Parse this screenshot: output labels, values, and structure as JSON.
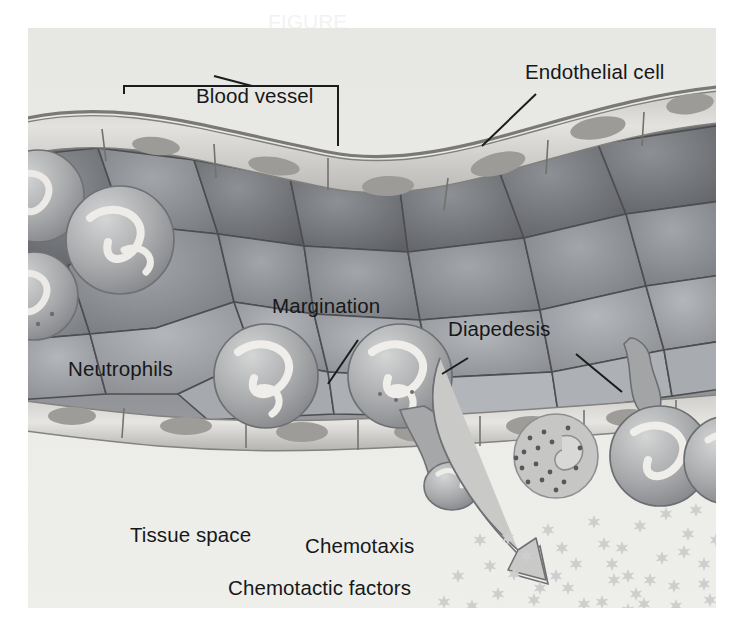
{
  "figure": {
    "kind": "biology-illustration",
    "style": "grayscale textbook airbrush illustration",
    "canvas": {
      "width": 744,
      "height": 635
    },
    "plate": {
      "x": 28,
      "y": 28,
      "width": 688,
      "height": 580,
      "background": "#e9e9e7"
    }
  },
  "palette": {
    "page_background": "#ffffff",
    "tissue_space": "#ebebe9",
    "vessel_lumen_dark": "#5e6064",
    "vessel_lumen_mid": "#7e8186",
    "vessel_lumen_light": "#9b9ea2",
    "endothelium_pale": "#d7d6d2",
    "endothelium_shade": "#b0afab",
    "endothelium_outline": "#7d7b77",
    "nucleus_gray": "#9a9894",
    "neutrophil_body": "#a9aaac",
    "neutrophil_highlight": "#e8e8e6",
    "granule_dark": "#55585c",
    "chemotactic_star": "#cfd0cf",
    "arrow_fill": "#c9cac8",
    "arrow_stroke": "#6e7073",
    "label_text": "#17181a",
    "leader_line": "#1b1c1e"
  },
  "labels": [
    {
      "id": "blood-vessel",
      "text": "Blood vessel",
      "x": 196,
      "y": 84,
      "leader": "bracket-with-stem"
    },
    {
      "id": "endothelial-cell",
      "text": "Endothelial cell",
      "x": 525,
      "y": 60,
      "leader": "diagonal-line"
    },
    {
      "id": "margination",
      "text": "Margination",
      "x": 272,
      "y": 294,
      "leader": "diagonal-line"
    },
    {
      "id": "diapedesis",
      "text": "Diapedesis",
      "x": 448,
      "y": 317,
      "leader": "two-diagonal-lines"
    },
    {
      "id": "neutrophils",
      "text": "Neutrophils",
      "x": 68,
      "y": 357,
      "leader": "none"
    },
    {
      "id": "tissue-space",
      "text": "Tissue space",
      "x": 130,
      "y": 523,
      "leader": "none"
    },
    {
      "id": "chemotaxis",
      "text": "Chemotaxis",
      "x": 305,
      "y": 534,
      "leader": "curved-arrow"
    },
    {
      "id": "chemotactic-factors",
      "text": "Chemotactic factors",
      "x": 228,
      "y": 576,
      "leader": "none"
    }
  ],
  "ghost_text": {
    "text": "FIGURE",
    "x": 268,
    "y": 18
  },
  "structures": {
    "upper_vessel_wall": "row of flattened pale endothelial cells with oval nuclei forming the top border of the vessel",
    "lower_vessel_wall": "row of flattened pale endothelial cells with oval nuclei forming the bottom border of the vessel",
    "lumen_contents": "large polygonal erythrocytes packed in the vessel lumen, dark gray with darker junction outlines",
    "neutrophil_count_in_lumen": 5,
    "marginating_neutrophils": 2,
    "diapedesis_events": 2,
    "granulocyte_in_tissue": 1,
    "chemotactic_factor_particles": 44,
    "chemotaxis_arrow": "curved outlined gray arrow sweeping from the vessel wall down and right toward the chemotactic factor gradient"
  }
}
